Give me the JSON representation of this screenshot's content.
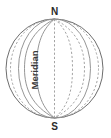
{
  "figure": {
    "type": "geometry-diagram",
    "canvas": {
      "width": 111,
      "height": 138,
      "background": "#ffffff"
    }
  },
  "labels": {
    "north_pole": "N",
    "south_pole": "S",
    "meridian": "Meridian"
  },
  "sphere": {
    "center_x": 54.5,
    "center_y": 68.5,
    "radius_x": 48.5,
    "radius_y": 49.5,
    "outline_color": "#6e6e6e"
  },
  "label_positions": {
    "north_pole": {
      "x": 54.5,
      "y": 11
    },
    "south_pole": {
      "x": 54.5,
      "y": 127
    },
    "meridian": {
      "x": 35,
      "y": 70,
      "rotation": -90
    }
  },
  "meridians": [
    {
      "name": "meridian-front-1",
      "offset": -36,
      "style": "solid"
    },
    {
      "name": "meridian-front-2",
      "offset": -24,
      "style": "solid"
    },
    {
      "name": "meridian-front-3",
      "offset": -12,
      "style": "solid"
    },
    {
      "name": "meridian-axis",
      "offset": 0,
      "style": "dashed"
    },
    {
      "name": "meridian-back-1",
      "offset": 12,
      "style": "dashed"
    },
    {
      "name": "meridian-back-2",
      "offset": 24,
      "style": "dashed"
    },
    {
      "name": "meridian-back-3",
      "offset": 36,
      "style": "dashed"
    }
  ],
  "colors": {
    "outline": "#6e6e6e",
    "meridian_solid": "#8a8a8a",
    "meridian_dashed": "#9a9a9a",
    "text": "#2b2b2b",
    "background": "#ffffff"
  }
}
